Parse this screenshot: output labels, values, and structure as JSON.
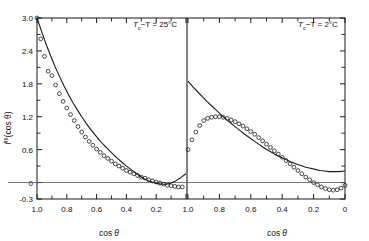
{
  "figure": {
    "ylabel_main": "f",
    "ylabel_sup": "III",
    "ylabel_arg": "(cos θ)",
    "xlabel_main": "cos",
    "xlabel_var": "θ"
  },
  "panels": [
    {
      "id": "left",
      "title_prefix": "T",
      "title_sub": "c",
      "title_rest": "−T = 25°C",
      "title_plain": "T_c − T = 25°C"
    },
    {
      "id": "right",
      "title_prefix": "T",
      "title_sub": "c",
      "title_rest": "−T = 2°C",
      "title_plain": "T_c − T = 2°C"
    }
  ],
  "axes": {
    "y_ticks": [
      "3.0",
      "2.4",
      "1.8",
      "1.2",
      "0.6",
      "0",
      "-0.3"
    ],
    "y_tick_values": [
      3.0,
      2.4,
      1.8,
      1.2,
      0.6,
      0,
      -0.3
    ],
    "y_min": -0.3,
    "y_max": 3.0,
    "x_ticks_left": [
      "1.0",
      "0.8",
      "0.6",
      "0.4",
      "0.2"
    ],
    "x_ticks_right": [
      "1.0",
      "0.8",
      "0.6",
      "0.4",
      "0.2",
      "0"
    ],
    "x_min": 0.0,
    "x_max": 1.0,
    "x_direction": "decreasing"
  },
  "chart_data": {
    "type": "scatter",
    "title": "",
    "xlabel": "cos θ",
    "ylabel": "f III (cos θ)",
    "xlim": [
      1.0,
      0.0
    ],
    "ylim": [
      -0.3,
      3.0
    ],
    "grid": false,
    "legend": "none",
    "marker": "open-circle",
    "panels": [
      {
        "name": "T_c − T = 25°C",
        "series": [
          {
            "name": "theory",
            "type": "line",
            "x": [
              1.0,
              0.97,
              0.94,
              0.91,
              0.88,
              0.85,
              0.82,
              0.79,
              0.76,
              0.73,
              0.7,
              0.67,
              0.64,
              0.61,
              0.58,
              0.55,
              0.52,
              0.49,
              0.46,
              0.43,
              0.4,
              0.37,
              0.34,
              0.31,
              0.28,
              0.25,
              0.22,
              0.19,
              0.16,
              0.13,
              0.1,
              0.07,
              0.04,
              0.0
            ],
            "y": [
              3.0,
              2.76,
              2.53,
              2.32,
              2.12,
              1.94,
              1.77,
              1.61,
              1.46,
              1.33,
              1.2,
              1.08,
              0.97,
              0.87,
              0.77,
              0.68,
              0.6,
              0.52,
              0.44,
              0.37,
              0.3,
              0.24,
              0.18,
              0.12,
              0.07,
              0.03,
              0.0,
              -0.02,
              -0.03,
              -0.03,
              -0.01,
              0.03,
              0.08,
              0.16
            ]
          },
          {
            "name": "measured",
            "type": "scatter",
            "x": [
              1.0,
              0.975,
              0.95,
              0.925,
              0.9,
              0.875,
              0.85,
              0.825,
              0.8,
              0.775,
              0.75,
              0.725,
              0.7,
              0.675,
              0.65,
              0.625,
              0.6,
              0.575,
              0.55,
              0.525,
              0.5,
              0.475,
              0.45,
              0.425,
              0.4,
              0.375,
              0.35,
              0.325,
              0.3,
              0.275,
              0.25,
              0.225,
              0.2,
              0.175,
              0.15,
              0.125,
              0.1,
              0.075,
              0.05,
              0.025
            ],
            "y": [
              3.0,
              2.62,
              2.3,
              2.03,
              1.95,
              1.78,
              1.62,
              1.48,
              1.36,
              1.24,
              1.13,
              1.02,
              0.92,
              0.83,
              0.75,
              0.68,
              0.61,
              0.55,
              0.49,
              0.44,
              0.39,
              0.34,
              0.3,
              0.26,
              0.22,
              0.19,
              0.16,
              0.13,
              0.1,
              0.08,
              0.05,
              0.03,
              0.01,
              -0.01,
              -0.03,
              -0.05,
              -0.06,
              -0.07,
              -0.08,
              -0.08
            ]
          }
        ]
      },
      {
        "name": "T_c − T = 2°C",
        "series": [
          {
            "name": "theory",
            "type": "line",
            "x": [
              1.0,
              0.97,
              0.94,
              0.91,
              0.88,
              0.85,
              0.82,
              0.79,
              0.76,
              0.73,
              0.7,
              0.67,
              0.64,
              0.61,
              0.58,
              0.55,
              0.52,
              0.49,
              0.46,
              0.43,
              0.4,
              0.37,
              0.34,
              0.31,
              0.28,
              0.25,
              0.22,
              0.19,
              0.16,
              0.13,
              0.1,
              0.07,
              0.04,
              0.0
            ],
            "y": [
              1.85,
              1.75,
              1.66,
              1.57,
              1.48,
              1.4,
              1.32,
              1.24,
              1.16,
              1.09,
              1.02,
              0.95,
              0.88,
              0.82,
              0.76,
              0.7,
              0.64,
              0.59,
              0.54,
              0.49,
              0.45,
              0.41,
              0.37,
              0.34,
              0.31,
              0.28,
              0.26,
              0.24,
              0.22,
              0.21,
              0.2,
              0.2,
              0.2,
              0.21
            ]
          },
          {
            "name": "measured",
            "type": "scatter",
            "x": [
              1.0,
              0.975,
              0.95,
              0.925,
              0.9,
              0.875,
              0.85,
              0.825,
              0.8,
              0.775,
              0.75,
              0.725,
              0.7,
              0.675,
              0.65,
              0.625,
              0.6,
              0.575,
              0.55,
              0.525,
              0.5,
              0.475,
              0.45,
              0.425,
              0.4,
              0.375,
              0.35,
              0.325,
              0.3,
              0.275,
              0.25,
              0.225,
              0.2,
              0.175,
              0.15,
              0.125,
              0.1,
              0.075,
              0.05,
              0.025,
              0.0
            ],
            "y": [
              0.6,
              0.78,
              0.92,
              1.04,
              1.13,
              1.17,
              1.19,
              1.2,
              1.2,
              1.19,
              1.17,
              1.14,
              1.11,
              1.07,
              1.03,
              0.98,
              0.93,
              0.88,
              0.82,
              0.76,
              0.7,
              0.64,
              0.58,
              0.52,
              0.46,
              0.4,
              0.34,
              0.28,
              0.22,
              0.16,
              0.1,
              0.05,
              0.0,
              -0.04,
              -0.08,
              -0.11,
              -0.13,
              -0.14,
              -0.13,
              -0.1,
              -0.05
            ]
          }
        ]
      }
    ]
  }
}
